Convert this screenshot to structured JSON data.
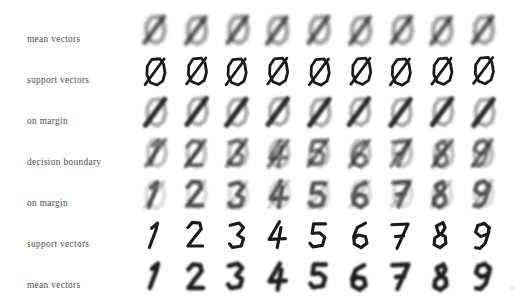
{
  "figure": {
    "title": "",
    "background_color": "#ffffff",
    "ink_color": "#1a1a1a",
    "label_color": "#4a4a4a",
    "grid": {
      "rows": 7,
      "columns": 9,
      "cell_px": 37,
      "pitch_x": 41,
      "pitch_y": 41,
      "origin_x": 137,
      "origin_y": 12
    }
  },
  "row_labels": [
    {
      "label": "mean vectors"
    },
    {
      "label": "support vectors"
    },
    {
      "label": "on margin"
    },
    {
      "label": "decision boundary"
    },
    {
      "label": "on margin"
    },
    {
      "label": "support vectors"
    },
    {
      "label": "mean vectors"
    }
  ],
  "column_digits": [
    "1",
    "2",
    "3",
    "4",
    "5",
    "6",
    "7",
    "8",
    "9"
  ],
  "chart_data": {
    "type": "heatmap",
    "title": "",
    "xlabel": "",
    "ylabel": "",
    "row_names": [
      "mean vectors",
      "support vectors",
      "on margin",
      "decision boundary",
      "on margin",
      "support vectors",
      "mean vectors"
    ],
    "column_labels": [
      "1",
      "2",
      "3",
      "4",
      "5",
      "6",
      "7",
      "8",
      "9"
    ],
    "rows": [
      {
        "name": "mean vectors",
        "index": 0,
        "style": "blurred-mean",
        "blur": 2.6,
        "contrast": 0.78,
        "glyphs": [
          "0+1",
          "0+1",
          "0+1",
          "0+1",
          "0+1",
          "0+1",
          "0+1",
          "0+1",
          "0+1"
        ],
        "note": "blurry zero with diagonal stroke, nearly identical across all nine columns"
      },
      {
        "name": "support vectors",
        "index": 1,
        "style": "sharp-handwritten",
        "blur": 0.2,
        "contrast": 1.0,
        "glyphs": [
          "0/",
          "0/",
          "0|",
          "0/",
          "0/",
          "0|",
          "0/",
          "0|",
          "0/"
        ],
        "note": "crisp handwritten zeros crossed by a one-like stroke"
      },
      {
        "name": "on margin",
        "index": 2,
        "style": "blurred-dark",
        "blur": 2.2,
        "contrast": 0.9,
        "glyphs": [
          "0+1",
          "0+1",
          "0+1",
          "0+1",
          "0+1",
          "0+1",
          "0+1",
          "0+1",
          "0+1"
        ]
      },
      {
        "name": "decision boundary",
        "index": 3,
        "style": "blurred-blend",
        "blur": 2.2,
        "contrast": 0.95,
        "glyphs": [
          "1",
          "2",
          "3",
          "4",
          "5",
          "6",
          "7",
          "8",
          "9"
        ],
        "note": "ambiguous blends; zero and target digit equally weighted"
      },
      {
        "name": "on margin",
        "index": 4,
        "style": "blurred-light",
        "blur": 2.2,
        "contrast": 0.88,
        "glyphs": [
          "1",
          "2",
          "3",
          "4",
          "5",
          "6",
          "7",
          "8",
          "9"
        ]
      },
      {
        "name": "support vectors",
        "index": 5,
        "style": "sharp-handwritten",
        "blur": 0.2,
        "contrast": 1.0,
        "glyphs": [
          "1",
          "2",
          "3",
          "4",
          "5",
          "6",
          "7",
          "8",
          "9"
        ],
        "note": "crisp handwritten target digits"
      },
      {
        "name": "mean vectors",
        "index": 6,
        "style": "blurred-mean",
        "blur": 1.8,
        "contrast": 1.0,
        "glyphs": [
          "1",
          "2",
          "3",
          "4",
          "5",
          "6",
          "7",
          "8",
          "9"
        ],
        "note": "class mean images of digits one through nine"
      }
    ]
  }
}
